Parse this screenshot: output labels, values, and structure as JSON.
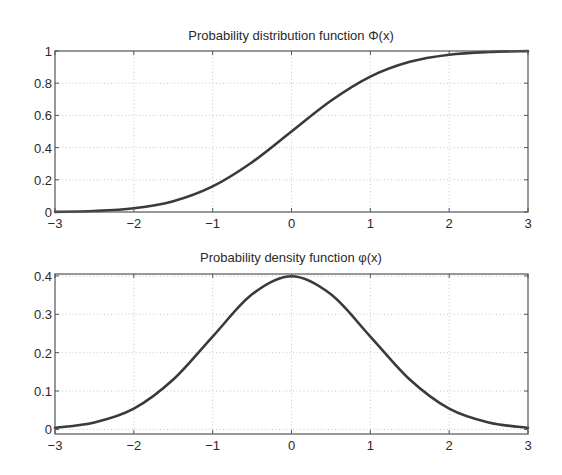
{
  "chart_data": [
    {
      "type": "line",
      "title": "Probability distribution function Φ(x)",
      "xlabel": "",
      "ylabel": "",
      "xlim": [
        -3,
        3
      ],
      "ylim": [
        0,
        1
      ],
      "xticks": [
        -3,
        -2,
        -1,
        0,
        1,
        2,
        3
      ],
      "xtick_labels": [
        "−3",
        "−2",
        "−1",
        "0",
        "1",
        "2",
        "3"
      ],
      "yticks": [
        0,
        0.2,
        0.4,
        0.6,
        0.8,
        1
      ],
      "ytick_labels": [
        "0",
        "0.2",
        "0.4",
        "0.6",
        "0.8",
        "1"
      ],
      "grid": true,
      "legend": null,
      "series": [
        {
          "name": "Φ(x)",
          "x": [
            -3,
            -2.5,
            -2,
            -1.5,
            -1,
            -0.5,
            0,
            0.5,
            1,
            1.5,
            2,
            2.5,
            3
          ],
          "values": [
            0.001,
            0.006,
            0.023,
            0.067,
            0.159,
            0.309,
            0.5,
            0.691,
            0.841,
            0.933,
            0.977,
            0.994,
            0.999
          ]
        }
      ],
      "layout": {
        "left": 55,
        "right": 528,
        "top": 51,
        "bottom": 212
      }
    },
    {
      "type": "line",
      "title": "Probability density function φ(x)",
      "xlabel": "",
      "ylabel": "",
      "xlim": [
        -3,
        3
      ],
      "ylim": [
        -0.012,
        0.405
      ],
      "xticks": [
        -3,
        -2,
        -1,
        0,
        1,
        2,
        3
      ],
      "xtick_labels": [
        "−3",
        "−2",
        "−1",
        "0",
        "1",
        "2",
        "3"
      ],
      "yticks": [
        0,
        0.1,
        0.2,
        0.3,
        0.4
      ],
      "ytick_labels": [
        "0",
        "0.1",
        "0.2",
        "0.3",
        "0.4"
      ],
      "grid": true,
      "legend": null,
      "series": [
        {
          "name": "φ(x)",
          "x": [
            -3,
            -2.5,
            -2,
            -1.5,
            -1,
            -0.5,
            0,
            0.5,
            1,
            1.5,
            2,
            2.5,
            3
          ],
          "values": [
            0.004,
            0.018,
            0.054,
            0.13,
            0.242,
            0.352,
            0.399,
            0.352,
            0.242,
            0.13,
            0.054,
            0.018,
            0.004
          ]
        }
      ],
      "layout": {
        "left": 55,
        "right": 528,
        "top": 274,
        "bottom": 434
      }
    }
  ],
  "style": {
    "curve_color": "#3a3a3a",
    "grid_color": "#b8b8b8",
    "frame_color": "#555555",
    "text_color": "#2a2a2a"
  }
}
